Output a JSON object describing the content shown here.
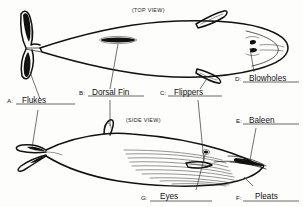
{
  "diagram": {
    "views": [
      {
        "id": "top",
        "caption": "(TOP VIEW)"
      },
      {
        "id": "side",
        "caption": "(SIDE VIEW)"
      }
    ],
    "labels": [
      {
        "key": "A",
        "letter": "A:",
        "term": "Flukes",
        "view": "top-and-side"
      },
      {
        "key": "B",
        "letter": "B:",
        "term": "Dorsal Fin",
        "view": "top-and-side"
      },
      {
        "key": "C",
        "letter": "C:",
        "term": "Flippers",
        "view": "top-and-side"
      },
      {
        "key": "D",
        "letter": "D:",
        "term": "Blowholes",
        "view": "top"
      },
      {
        "key": "E",
        "letter": "E:",
        "term": "Baleen",
        "view": "side"
      },
      {
        "key": "F",
        "letter": "F:",
        "term": "Pleats",
        "view": "side"
      },
      {
        "key": "G",
        "letter": "G:",
        "term": "Eyes",
        "view": "side"
      }
    ],
    "colors": {
      "ink": "#111111",
      "paper": "#fdfdfb",
      "rule": "#444444"
    }
  }
}
